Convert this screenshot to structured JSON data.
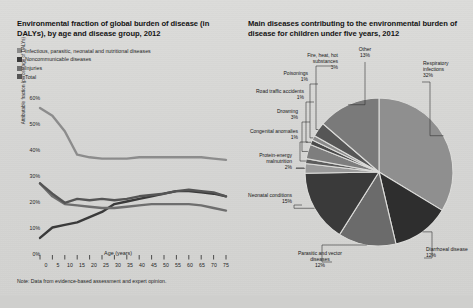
{
  "figure": {
    "left": {
      "title": "Environmental fraction of global burden of disease (in DALYs), by age and disease group, 2012",
      "note": "Note: Data from evidence-based assessment and expert opinion.",
      "legend": [
        {
          "label": "Infectious, parasitic, neonatal and nutritional diseases",
          "color": "#8c8c8c"
        },
        {
          "label": "Noncommunicable diseases",
          "color": "#3a3a3a"
        },
        {
          "label": "Injuries",
          "color": "#6e6e6e"
        },
        {
          "label": "Total",
          "color": "#555555"
        }
      ]
    },
    "right": {
      "title": "Main diseases contributing to the environmental burden of disease for children under five years, 2012"
    }
  },
  "chart_data": [
    {
      "type": "line",
      "title": "Environmental fraction of global burden of disease (in DALYs), by age and disease group, 2012",
      "xlabel": "Age (years)",
      "ylabel": "Attributable fraction (percentage of DALYs)",
      "xlim": [
        0,
        75
      ],
      "ylim": [
        0,
        60
      ],
      "grid": false,
      "legend_position": "top-left",
      "xticklabels": [
        "0",
        "5",
        "10",
        "15",
        "20",
        "25",
        "30",
        "35",
        "40",
        "45",
        "50",
        "55",
        "60",
        "65",
        "70",
        "75"
      ],
      "yticklabels": [
        "0%",
        "10%",
        "20%",
        "30%",
        "40%",
        "50%",
        "60%"
      ],
      "x": [
        0,
        5,
        10,
        15,
        20,
        25,
        30,
        35,
        40,
        45,
        50,
        55,
        60,
        65,
        70,
        75
      ],
      "series": [
        {
          "name": "Infectious, parasitic, neonatal and nutritional diseases",
          "color": "#8c8c8c",
          "values": [
            56,
            53,
            47,
            38,
            37,
            36.5,
            36.5,
            36.5,
            37,
            37,
            37,
            37,
            37,
            37,
            36.5,
            36
          ]
        },
        {
          "name": "Noncommunicable diseases",
          "color": "#3a3a3a",
          "values": [
            6,
            10,
            11,
            12,
            14,
            16,
            19,
            20,
            21,
            22,
            23,
            24,
            24,
            23.5,
            23,
            22
          ]
        },
        {
          "name": "Injuries",
          "color": "#6e6e6e",
          "values": [
            27,
            22,
            19,
            18.5,
            18,
            17.5,
            17.5,
            18,
            18.5,
            19,
            19,
            19,
            19,
            18.5,
            17.5,
            16.5
          ]
        },
        {
          "name": "Total",
          "color": "#555555",
          "values": [
            27,
            23,
            19.5,
            21,
            20.5,
            21,
            20.5,
            21,
            22,
            22.5,
            23,
            24,
            24.5,
            24,
            23.5,
            22
          ]
        }
      ]
    },
    {
      "type": "pie",
      "title": "Main diseases contributing to the environmental burden of disease for children under five years, 2012",
      "labels": [
        "Respiratory infections",
        "Diarrhoeal disease",
        "Parasitic and vector diseases",
        "Neonatal conditions",
        "Protein-energy malnutrition",
        "Congenital anomalies",
        "Drowning",
        "Road traffic accidents",
        "Poisonings",
        "Fire, heat, hot substances",
        "Other"
      ],
      "values": [
        32,
        12,
        12,
        15,
        2,
        1,
        3,
        1,
        1,
        3,
        13
      ],
      "percent_labels": [
        "32%",
        "12%",
        "12%",
        "15%",
        "2%",
        "1%",
        "3%",
        "1%",
        "1%",
        "3%",
        "13%"
      ],
      "colors": [
        "#8f8f8f",
        "#2e2e2e",
        "#6b6b6b",
        "#3a3a3a",
        "#9a9a9a",
        "#5c5c5c",
        "#7e7e7e",
        "#4a4a4a",
        "#8a8a8a",
        "#565656",
        "#7a7a7a"
      ]
    }
  ],
  "pie_labels": [
    {
      "name": "respiratory-infections",
      "label": "Respiratory infections",
      "pct": "32%"
    },
    {
      "name": "diarrhoeal-disease",
      "label": "Diarrhoeal disease",
      "pct": "12%"
    },
    {
      "name": "parasitic-and-vector-diseases",
      "label": "Parasitic and vector diseases",
      "pct": "12%"
    },
    {
      "name": "neonatal-conditions",
      "label": "Neonatal conditions",
      "pct": "15%"
    },
    {
      "name": "protein-energy-malnutrition",
      "label": "Protein-energy malnutrition",
      "pct": "2%"
    },
    {
      "name": "congenital-anomalies",
      "label": "Congenital anomalies",
      "pct": "1%"
    },
    {
      "name": "drowning",
      "label": "Drowning",
      "pct": "3%"
    },
    {
      "name": "road-traffic-accidents",
      "label": "Road traffic accidents",
      "pct": "1%"
    },
    {
      "name": "poisonings",
      "label": "Poisonings",
      "pct": "1%"
    },
    {
      "name": "fire-heat-hot-substances",
      "label": "Fire, heat, hot substances",
      "pct": "3%"
    },
    {
      "name": "other",
      "label": "Other",
      "pct": "13%"
    }
  ]
}
